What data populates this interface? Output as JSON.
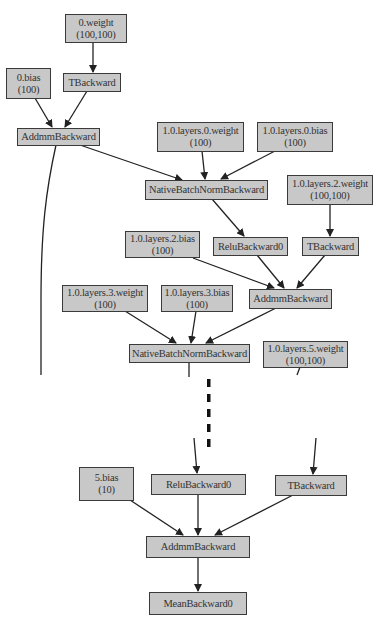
{
  "diagram": {
    "type": "autograd-computation-graph",
    "colors": {
      "node_fill": "#c8c8c8",
      "node_border": "#3a3a3a",
      "edge": "#222222",
      "text": "#333333"
    },
    "nodes": [
      {
        "id": "n0w",
        "line1": "0.weight",
        "line2": "(100,100)"
      },
      {
        "id": "n0b",
        "line1": "0.bias",
        "line2": "(100)"
      },
      {
        "id": "t1",
        "line1": "TBackward",
        "line2": null
      },
      {
        "id": "a1",
        "line1": "AddmmBackward",
        "line2": null
      },
      {
        "id": "l0w",
        "line1": "1.0.layers.0.weight",
        "line2": "(100)"
      },
      {
        "id": "l0b",
        "line1": "1.0.layers.0.bias",
        "line2": "(100)"
      },
      {
        "id": "bn1",
        "line1": "NativeBatchNormBackward",
        "line2": null
      },
      {
        "id": "l2w",
        "line1": "1.0.layers.2.weight",
        "line2": "(100,100)"
      },
      {
        "id": "r1",
        "line1": "ReluBackward0",
        "line2": null
      },
      {
        "id": "t2",
        "line1": "TBackward",
        "line2": null
      },
      {
        "id": "l2b",
        "line1": "1.0.layers.2.bias",
        "line2": "(100)"
      },
      {
        "id": "a2",
        "line1": "AddmmBackward",
        "line2": null
      },
      {
        "id": "l3w",
        "line1": "1.0.layers.3.weight",
        "line2": "(100)"
      },
      {
        "id": "l3b",
        "line1": "1.0.layers.3.bias",
        "line2": "(100)"
      },
      {
        "id": "bn2",
        "line1": "NativeBatchNormBackward",
        "line2": null
      },
      {
        "id": "l5w",
        "line1": "1.0.layers.5.weight",
        "line2": "(100,100)"
      },
      {
        "id": "b5",
        "line1": "5.bias",
        "line2": "(10)"
      },
      {
        "id": "r3",
        "line1": "ReluBackward0",
        "line2": null
      },
      {
        "id": "t3",
        "line1": "TBackward",
        "line2": null
      },
      {
        "id": "a3",
        "line1": "AddmmBackward",
        "line2": null
      },
      {
        "id": "mean",
        "line1": "MeanBackward0",
        "line2": null
      }
    ],
    "edges": [
      [
        "0.weight",
        "TBackward"
      ],
      [
        "0.bias",
        "AddmmBackward"
      ],
      [
        "TBackward",
        "AddmmBackward"
      ],
      [
        "AddmmBackward",
        "NativeBatchNormBackward"
      ],
      [
        "1.0.layers.0.weight",
        "NativeBatchNormBackward"
      ],
      [
        "1.0.layers.0.bias",
        "NativeBatchNormBackward"
      ],
      [
        "NativeBatchNormBackward",
        "ReluBackward0"
      ],
      [
        "1.0.layers.2.weight",
        "TBackward"
      ],
      [
        "1.0.layers.2.bias",
        "AddmmBackward"
      ],
      [
        "ReluBackward0",
        "AddmmBackward"
      ],
      [
        "TBackward",
        "AddmmBackward"
      ],
      [
        "1.0.layers.3.weight",
        "NativeBatchNormBackward"
      ],
      [
        "1.0.layers.3.bias",
        "NativeBatchNormBackward"
      ],
      [
        "AddmmBackward",
        "NativeBatchNormBackward"
      ],
      [
        "...",
        "ReluBackward0"
      ],
      [
        "1.0.layers.5.weight",
        "TBackward"
      ],
      [
        "5.bias",
        "AddmmBackward"
      ],
      [
        "ReluBackward0",
        "AddmmBackward"
      ],
      [
        "TBackward",
        "AddmmBackward"
      ],
      [
        "AddmmBackward",
        "MeanBackward0"
      ]
    ],
    "elision": "dashed vertical line indicating omitted layers"
  }
}
